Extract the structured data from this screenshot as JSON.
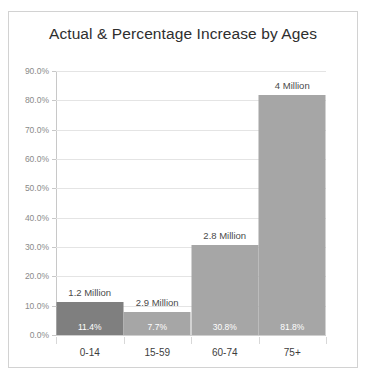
{
  "chart_data": {
    "type": "bar",
    "title": "Actual & Percentage Increase by Ages",
    "xlabel": "",
    "ylabel": "",
    "categories": [
      "0-14",
      "15-59",
      "60-74",
      "75+"
    ],
    "values": [
      11.4,
      7.7,
      30.8,
      81.8
    ],
    "value_labels": [
      "11.4%",
      "7.7%",
      "30.8%",
      "81.8%"
    ],
    "point_labels": [
      "1.2 Million",
      "2.9 Million",
      "2.8 Million",
      "4 Million"
    ],
    "ylim": [
      0,
      90
    ],
    "ytick_values": [
      0,
      10,
      20,
      30,
      40,
      50,
      60,
      70,
      80,
      90
    ],
    "ytick_labels": [
      "0.0%",
      "10.0%",
      "20.0%",
      "30.0%",
      "40.0%",
      "50.0%",
      "60.0%",
      "70.0%",
      "80.0%",
      "90.0%"
    ],
    "grid": true,
    "legend": "none",
    "bar_colors": [
      "#7f7f7f",
      "#a6a6a6",
      "#a6a6a6",
      "#a6a6a6"
    ],
    "colors": {
      "frame_border": "#d2d2d2",
      "gridline": "#e4e4e4",
      "axis_line": "#c8c8c8",
      "title_text": "#2e2e2e",
      "ytick_text": "#8a8a8a",
      "xtick_text": "#3d3d3d",
      "value_label_text": "#4a4a4a",
      "pct_label_text": "#ffffff",
      "plot_background": "#ffffff"
    }
  }
}
